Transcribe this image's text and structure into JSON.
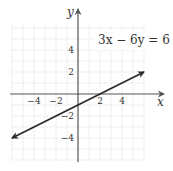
{
  "chart_data": {
    "type": "line",
    "title": "",
    "xlabel": "x",
    "ylabel": "y",
    "xlim": [
      -6,
      6
    ],
    "ylim": [
      -6,
      6
    ],
    "grid": true,
    "x_ticks": [
      -4,
      -2,
      2,
      4
    ],
    "y_ticks": [
      4,
      2,
      -2,
      -4
    ],
    "x_tick_labels": [
      "−4",
      "−2",
      "2",
      "4"
    ],
    "y_tick_labels": [
      "4",
      "2",
      "−2",
      "−4"
    ],
    "annotation": "3x − 6y = 6",
    "series": [
      {
        "name": "3x - 6y = 6",
        "equation": "y = 0.5x - 1",
        "x": [
          -6,
          0,
          2,
          6
        ],
        "y": [
          -4,
          -1,
          0,
          2
        ],
        "arrows": "both"
      }
    ],
    "colors": {
      "line": "#2a2a2a",
      "axis": "#555555",
      "grid": "#d6d6d6"
    }
  }
}
